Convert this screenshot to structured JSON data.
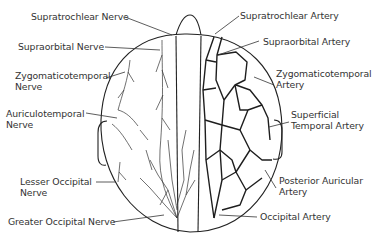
{
  "diagram": {
    "left_side": "nerves",
    "right_side": "arteries",
    "labels_left": [
      {
        "id": "supratrochlear-nerve",
        "lines": [
          "Supratrochlear Nerve"
        ]
      },
      {
        "id": "supraorbital-nerve",
        "lines": [
          "Supraorbital Nerve"
        ]
      },
      {
        "id": "zygomaticotemporal-nerve",
        "lines": [
          "Zygomaticotemporal",
          "Nerve"
        ]
      },
      {
        "id": "auriculotemporal-nerve",
        "lines": [
          "Auriculotemporal",
          "Nerve"
        ]
      },
      {
        "id": "lesser-occipital-nerve",
        "lines": [
          "Lesser Occipital",
          "Nerve"
        ]
      },
      {
        "id": "greater-occipital-nerve",
        "lines": [
          "Greater Occipital Nerve"
        ]
      }
    ],
    "labels_right": [
      {
        "id": "supratrochlear-artery",
        "lines": [
          "Supratrochlear Artery"
        ]
      },
      {
        "id": "supraorbital-artery",
        "lines": [
          "Supraorbital Artery"
        ]
      },
      {
        "id": "zygomaticotemporal-artery",
        "lines": [
          "Zygomaticotemporal",
          "Artery"
        ]
      },
      {
        "id": "superficial-temporal-artery",
        "lines": [
          "Superficial",
          "Temporal Artery"
        ]
      },
      {
        "id": "posterior-auricular-artery",
        "lines": [
          "Posterior Auricular",
          "Artery"
        ]
      },
      {
        "id": "occipital-artery",
        "lines": [
          "Occipital Artery"
        ]
      }
    ]
  }
}
